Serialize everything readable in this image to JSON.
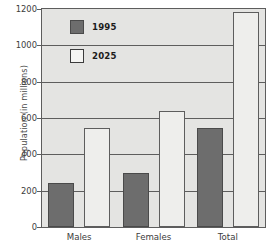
{
  "chart_data": {
    "type": "bar",
    "title": "",
    "subtitle": "",
    "xlabel": "",
    "ylabel": "Population (in millions)",
    "categories": [
      "Males",
      "Females",
      "Total"
    ],
    "series": [
      {
        "name": "1995",
        "values": [
          240,
          300,
          545
        ],
        "color": "#6d6d6d"
      },
      {
        "name": "2025",
        "values": [
          545,
          640,
          1185
        ],
        "color": "#eeeeec"
      }
    ],
    "ylim": [
      0,
      1200
    ],
    "y_ticks": [
      0,
      200,
      400,
      600,
      800,
      1000,
      1200
    ],
    "y_tick_labels": [
      "0",
      "200",
      "400",
      "600",
      "800",
      "1000",
      "1200"
    ],
    "grid": true,
    "grid_axis": "y",
    "legend_position": "top-left-inside",
    "legend_entries": [
      "1995",
      "2025"
    ],
    "annotations": [],
    "plot_background": "#e4e4e2",
    "axis_color": "#5d5d5d"
  }
}
